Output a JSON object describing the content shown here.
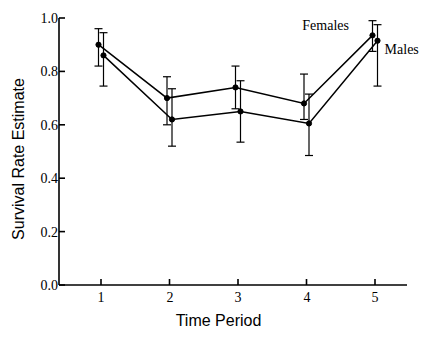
{
  "chart_data": {
    "type": "line",
    "title": "",
    "xlabel": "Time Period",
    "ylabel": "Survival Rate Estimate",
    "x": [
      1,
      2,
      3,
      4,
      5
    ],
    "xticklabels": [
      "1",
      "2",
      "3",
      "4",
      "5"
    ],
    "yticklabels": [
      "0.0",
      "0.2",
      "0.4",
      "0.6",
      "0.8",
      "1.0"
    ],
    "yticks": [
      0.0,
      0.2,
      0.4,
      0.6,
      0.8,
      1.0
    ],
    "xlim": [
      0.6,
      5.5
    ],
    "ylim": [
      0.0,
      1.0
    ],
    "grid": false,
    "legend_position": "inline-annotation",
    "series": [
      {
        "name": "Females",
        "values": [
          0.9,
          0.7,
          0.74,
          0.68,
          0.935
        ],
        "err_low": [
          0.82,
          0.6,
          0.66,
          0.62,
          0.875
        ],
        "err_high": [
          0.96,
          0.78,
          0.82,
          0.79,
          0.99
        ]
      },
      {
        "name": "Males",
        "values": [
          0.86,
          0.62,
          0.65,
          0.605,
          0.915
        ],
        "err_low": [
          0.745,
          0.52,
          0.535,
          0.485,
          0.745
        ],
        "err_high": [
          0.945,
          0.735,
          0.765,
          0.715,
          0.975
        ]
      }
    ],
    "annotations": [
      {
        "text": "Females",
        "x": 4.62,
        "y": 0.965
      },
      {
        "text": "Males",
        "x": 5.14,
        "y": 0.875
      }
    ],
    "style": {
      "line_color": "#000000",
      "marker": "circle",
      "marker_color": "#000000",
      "errorbar_color": "#000000",
      "axis_color": "#000000",
      "background": "#ffffff"
    }
  }
}
